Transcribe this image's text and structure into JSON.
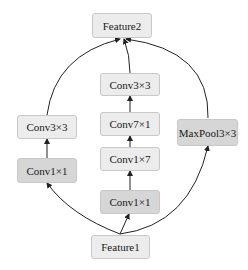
{
  "diagram": {
    "nodes": {
      "feature2": {
        "label": "Feature2"
      },
      "conv3x3_left": {
        "label": "Conv3×3"
      },
      "conv1x1_left": {
        "label": "Conv1×1"
      },
      "conv3x3_mid": {
        "label": "Conv3×3"
      },
      "conv7x1_mid": {
        "label": "Conv7×1"
      },
      "conv1x7_mid": {
        "label": "Conv1×7"
      },
      "conv1x1_mid": {
        "label": "Conv1×1"
      },
      "maxpool3x3": {
        "label": "MaxPool3×3"
      },
      "feature1": {
        "label": "Feature1"
      }
    },
    "edges": [
      {
        "from": "feature1",
        "to": "conv1x1_left"
      },
      {
        "from": "conv1x1_left",
        "to": "conv3x3_left"
      },
      {
        "from": "conv3x3_left",
        "to": "feature2"
      },
      {
        "from": "feature1",
        "to": "conv1x1_mid"
      },
      {
        "from": "conv1x1_mid",
        "to": "conv1x7_mid"
      },
      {
        "from": "conv1x7_mid",
        "to": "conv7x1_mid"
      },
      {
        "from": "conv7x1_mid",
        "to": "conv3x3_mid"
      },
      {
        "from": "conv3x3_mid",
        "to": "feature2"
      },
      {
        "from": "feature1",
        "to": "maxpool3x3"
      },
      {
        "from": "maxpool3x3",
        "to": "feature2"
      }
    ],
    "colors": {
      "light_box": "#ececec",
      "dark_box": "#d6d6d6",
      "edge": "#222222"
    }
  }
}
